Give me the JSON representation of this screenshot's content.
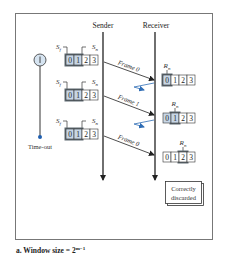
{
  "headers": {
    "sender": "Sender",
    "receiver": "Receiver"
  },
  "timer": {
    "icon": "timer-icon",
    "label": "Time-out"
  },
  "labels": {
    "sf": "S",
    "sf_sub": "f",
    "sn": "S",
    "sn_sub": "n",
    "rn": "R",
    "rn_sub": "n"
  },
  "sender_windows": [
    {
      "slots": [
        "0",
        "1",
        "2",
        "3"
      ],
      "window": [
        0,
        1
      ]
    },
    {
      "slots": [
        "0",
        "1",
        "2",
        "3"
      ],
      "window": [
        0,
        1
      ]
    },
    {
      "slots": [
        "0",
        "1",
        "2",
        "3"
      ],
      "window": [
        0,
        1
      ]
    }
  ],
  "receiver_windows": [
    {
      "slots": [
        "0",
        "1",
        "2",
        "3"
      ],
      "expected": 0
    },
    {
      "slots": [
        "0",
        "1",
        "2",
        "3"
      ],
      "expected": 1
    },
    {
      "slots": [
        "0",
        "1",
        "2",
        "3"
      ],
      "expected": 2
    }
  ],
  "frames": [
    {
      "label": "Frame 0"
    },
    {
      "label": "Frame 1"
    },
    {
      "label": "Frame 0"
    }
  ],
  "result_box": {
    "line1": "Correctly",
    "line2": "discarded"
  },
  "caption": {
    "prefix": "a. Window size = 2",
    "exponent": "m−1"
  },
  "colors": {
    "window_fill": "#c7d6e6",
    "window_dark": "#5f6a72",
    "ack_arrow": "#2f6db5",
    "timer_fill": "#d6e4f1",
    "timer_dot": "#1f5fb0"
  }
}
